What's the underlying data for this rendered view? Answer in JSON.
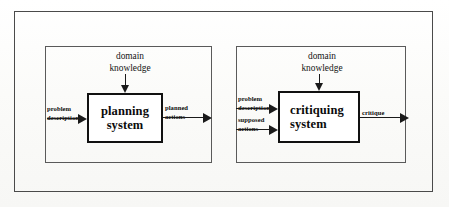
{
  "figure": {
    "type": "block-diagram",
    "panels": [
      {
        "id": "planning",
        "process": {
          "line1": "planning",
          "line2": "system"
        },
        "top_input": {
          "line1": "domain",
          "line2": "knowledge"
        },
        "inputs": [
          {
            "line1": "problem",
            "line2": "description"
          }
        ],
        "outputs": [
          {
            "line1": "planned",
            "line2": "actions"
          }
        ]
      },
      {
        "id": "critiquing",
        "process": {
          "line1": "critiquing",
          "line2": "system"
        },
        "top_input": {
          "line1": "domain",
          "line2": "knowledge"
        },
        "inputs": [
          {
            "line1": "problem",
            "line2": "description"
          },
          {
            "line1": "supposed",
            "line2": "actions"
          }
        ],
        "outputs": [
          {
            "line1": "critique",
            "line2": ""
          }
        ]
      }
    ]
  },
  "colors": {
    "ink": "#111111",
    "frame": "#4a4a4a",
    "panel_border": "#5a5a5a",
    "background": "#fdfdfc"
  }
}
